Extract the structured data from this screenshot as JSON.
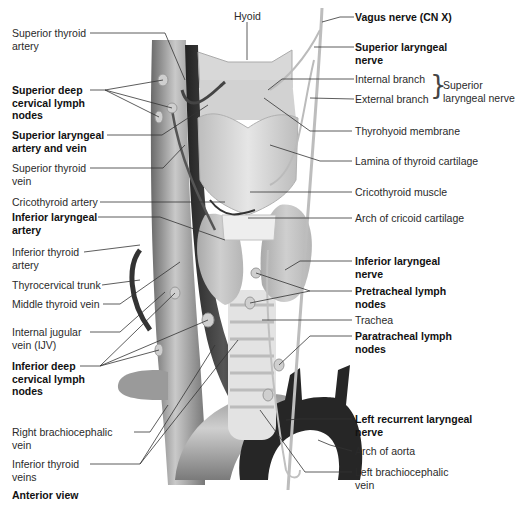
{
  "figure": {
    "view_label": "Anterior view",
    "center_label": "Hyoid",
    "left_labels": [
      {
        "text": "Superior thyroid\nartery",
        "bold": false
      },
      {
        "text": "Superior deep\ncervical lymph\nnodes",
        "bold": true
      },
      {
        "text": "Superior laryngeal\nartery and vein",
        "bold": true
      },
      {
        "text": "Superior thyroid\nvein",
        "bold": false
      },
      {
        "text": "Cricothyroid artery",
        "bold": false
      },
      {
        "text": "Inferior laryngeal\nartery",
        "bold": true
      },
      {
        "text": "Inferior thyroid\nartery",
        "bold": false
      },
      {
        "text": "Thyrocervical trunk",
        "bold": false
      },
      {
        "text": "Middle thyroid vein",
        "bold": false
      },
      {
        "text": "Internal jugular\nvein (IJV)",
        "bold": false
      },
      {
        "text": "Inferior deep\ncervical lymph\nnodes",
        "bold": true
      },
      {
        "text": "Right brachiocephalic\nvein",
        "bold": false
      },
      {
        "text": "Inferior thyroid\nveins",
        "bold": false
      }
    ],
    "right_labels": [
      {
        "text": "Vagus nerve (CN X)",
        "bold": true
      },
      {
        "text": "Superior laryngeal\nnerve",
        "bold": true
      },
      {
        "text": "Internal branch",
        "bold": false
      },
      {
        "text": "External branch",
        "bold": false
      },
      {
        "text": "Thyrohyoid membrane",
        "bold": false
      },
      {
        "text": "Lamina  of thyroid cartilage",
        "bold": false
      },
      {
        "text": "Cricothyroid muscle",
        "bold": false
      },
      {
        "text": "Arch of cricoid cartilage",
        "bold": false
      },
      {
        "text": "Inferior laryngeal\nnerve",
        "bold": true
      },
      {
        "text": "Pretracheal lymph\nnodes",
        "bold": true
      },
      {
        "text": "Trachea",
        "bold": false
      },
      {
        "text": "Paratracheal lymph\nnodes",
        "bold": true
      },
      {
        "text": "Left recurrent laryngeal\nnerve",
        "bold": true
      },
      {
        "text": "Arch of aorta",
        "bold": false
      },
      {
        "text": "Left brachiocephalic\nvein",
        "bold": false
      }
    ],
    "brace_group_label": "Superior\nlaryngeal nerve"
  }
}
